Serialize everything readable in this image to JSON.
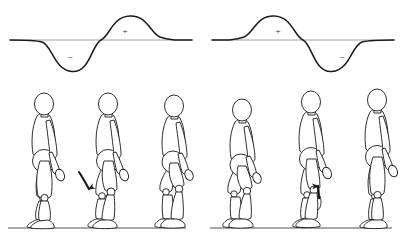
{
  "figure": {
    "width": 404,
    "height": 240,
    "background": "#ffffff",
    "stroke_color": "#1a1a1a",
    "baseline_color": "#7a7a7a"
  },
  "panels": [
    {
      "id": "left-panel",
      "name": "left-panel",
      "origin_x": 0,
      "curve": {
        "name": "moment-curve-left",
        "phase_order": "negative-then-positive",
        "baseline_y": 40,
        "x_start": 10,
        "x_end": 192,
        "trough_y": 72,
        "peak_y": 16,
        "trough_center_x": 72,
        "peak_center_x": 130,
        "zero_crossing_x": 101
      },
      "signs": [
        {
          "name": "negative-sign-left",
          "label": "−",
          "x": 70,
          "y": 57
        },
        {
          "name": "positive-sign-left",
          "label": "+",
          "x": 125,
          "y": 31
        }
      ],
      "ground_line": {
        "name": "ground-line-left",
        "x_start": 8,
        "x_end": 186,
        "y": 228
      },
      "arrow": {
        "name": "knee-arrow-left",
        "direction": "down",
        "description": "curved arrow pointing downward at the knee",
        "tip_x": 90,
        "tip_y": 190
      },
      "figures": [
        {
          "name": "mannequin-1",
          "x": 42,
          "scale": 1.0,
          "pose": "upright-stance",
          "knee_flex": 6
        },
        {
          "name": "mannequin-2",
          "x": 107,
          "scale": 1.0,
          "pose": "mid-stance-knee-flexed",
          "knee_flex": 26
        },
        {
          "name": "mannequin-3",
          "x": 172,
          "scale": 1.0,
          "pose": "deep-crouch",
          "knee_flex": 48
        }
      ]
    },
    {
      "id": "right-panel",
      "name": "right-panel",
      "origin_x": 202,
      "curve": {
        "name": "moment-curve-right",
        "phase_order": "positive-then-negative",
        "baseline_y": 40,
        "x_start": 10,
        "x_end": 192,
        "peak_y": 16,
        "trough_y": 72,
        "peak_center_x": 72,
        "trough_center_x": 130,
        "zero_crossing_x": 101
      },
      "signs": [
        {
          "name": "positive-sign-right",
          "label": "+",
          "x": 76,
          "y": 31
        },
        {
          "name": "negative-sign-right",
          "label": "−",
          "x": 140,
          "y": 57
        }
      ],
      "ground_line": {
        "name": "ground-line-right",
        "x_start": 8,
        "x_end": 190,
        "y": 228
      },
      "arrow": {
        "name": "knee-arrow-right",
        "direction": "up",
        "description": "arrow pointing upward at the knee",
        "tip_x": 116,
        "tip_y": 178
      },
      "figures": [
        {
          "name": "mannequin-4",
          "x": 38,
          "scale": 1.0,
          "pose": "deep-crouch",
          "knee_flex": 48
        },
        {
          "name": "mannequin-5",
          "x": 108,
          "scale": 1.0,
          "pose": "mid-stance-knee-flexed",
          "knee_flex": 22
        },
        {
          "name": "mannequin-6",
          "x": 174,
          "scale": 1.0,
          "pose": "upright-stance",
          "knee_flex": 8
        }
      ]
    }
  ]
}
